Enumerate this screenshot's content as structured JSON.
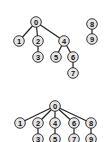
{
  "diagram": {
    "type": "tree-comparison",
    "node_fill": "#e6e6e6",
    "stroke": "#222222",
    "top_forest": {
      "nodes": [
        {
          "id": "0",
          "x": 36,
          "y": 22
        },
        {
          "id": "1",
          "x": 19,
          "y": 41
        },
        {
          "id": "2",
          "x": 38,
          "y": 41
        },
        {
          "id": "3",
          "x": 38,
          "y": 57
        },
        {
          "id": "4",
          "x": 64,
          "y": 41
        },
        {
          "id": "5",
          "x": 56,
          "y": 57
        },
        {
          "id": "6",
          "x": 73,
          "y": 57
        },
        {
          "id": "7",
          "x": 73,
          "y": 73
        },
        {
          "id": "8",
          "x": 92,
          "y": 24
        },
        {
          "id": "9",
          "x": 92,
          "y": 39
        }
      ],
      "edges": [
        [
          "0",
          "1"
        ],
        [
          "0",
          "2"
        ],
        [
          "2",
          "3"
        ],
        [
          "0",
          "4"
        ],
        [
          "4",
          "5"
        ],
        [
          "4",
          "6"
        ],
        [
          "6",
          "7"
        ],
        [
          "8",
          "9"
        ]
      ]
    },
    "bottom_tree": {
      "nodes": [
        {
          "id": "0",
          "x": 55,
          "y": 106
        },
        {
          "id": "1",
          "x": 20,
          "y": 123
        },
        {
          "id": "2",
          "x": 38,
          "y": 123
        },
        {
          "id": "3",
          "x": 38,
          "y": 139
        },
        {
          "id": "4",
          "x": 55,
          "y": 123
        },
        {
          "id": "5",
          "x": 55,
          "y": 139
        },
        {
          "id": "6",
          "x": 74,
          "y": 123
        },
        {
          "id": "7",
          "x": 74,
          "y": 139
        },
        {
          "id": "8",
          "x": 91,
          "y": 123
        },
        {
          "id": "9",
          "x": 91,
          "y": 139
        }
      ],
      "edges": [
        [
          "0",
          "1"
        ],
        [
          "0",
          "2"
        ],
        [
          "2",
          "3"
        ],
        [
          "0",
          "4"
        ],
        [
          "4",
          "5"
        ],
        [
          "0",
          "6"
        ],
        [
          "6",
          "7"
        ],
        [
          "0",
          "8"
        ],
        [
          "8",
          "9"
        ]
      ]
    }
  }
}
